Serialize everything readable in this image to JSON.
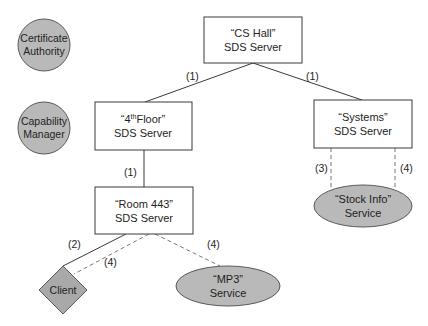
{
  "nodes": {
    "certificate_authority": {
      "line1": "Certificate",
      "line2": "Authority",
      "shape": "circle"
    },
    "capability_manager": {
      "line1": "Capability",
      "line2": "Manager",
      "shape": "circle"
    },
    "cs_hall": {
      "line1": "“CS Hall”",
      "line2": "SDS Server",
      "shape": "rectangle"
    },
    "fourth_floor": {
      "line1_prefix": "“4",
      "line1_sup": "th",
      "line1_suffix": "Floor”",
      "line2": "SDS Server",
      "shape": "rectangle"
    },
    "systems": {
      "line1": "“Systems”",
      "line2": "SDS Server",
      "shape": "rectangle"
    },
    "room_443": {
      "line1": "“Room 443”",
      "line2": "SDS Server",
      "shape": "rectangle"
    },
    "client": {
      "line1": "Client",
      "shape": "diamond"
    },
    "mp3_service": {
      "line1": "“MP3”",
      "line2": "Service",
      "shape": "ellipse"
    },
    "stock_info_service": {
      "line1": "“Stock Info”",
      "line2": "Service",
      "shape": "ellipse"
    }
  },
  "edges": [
    {
      "from": "cs_hall",
      "to": "fourth_floor",
      "style": "solid",
      "label": "(1)"
    },
    {
      "from": "cs_hall",
      "to": "systems",
      "style": "solid",
      "label": "(1)"
    },
    {
      "from": "fourth_floor",
      "to": "room_443",
      "style": "solid",
      "label": "(1)"
    },
    {
      "from": "room_443",
      "to": "client",
      "style": "solid",
      "label": "(2)"
    },
    {
      "from": "room_443",
      "to": "client",
      "style": "dashed",
      "label": "(4)"
    },
    {
      "from": "room_443",
      "to": "mp3_service",
      "style": "dashed",
      "label": "(4)"
    },
    {
      "from": "systems",
      "to": "stock_info_service",
      "style": "dashed",
      "label": "(3)"
    },
    {
      "from": "systems",
      "to": "stock_info_service",
      "style": "dashed",
      "label": "(4)"
    }
  ],
  "colors": {
    "box_fill": "#ffffff",
    "shape_fill": "#b9b9b9",
    "diamond_fill": "#a9a9a9",
    "stroke": "#3a3a3a"
  }
}
